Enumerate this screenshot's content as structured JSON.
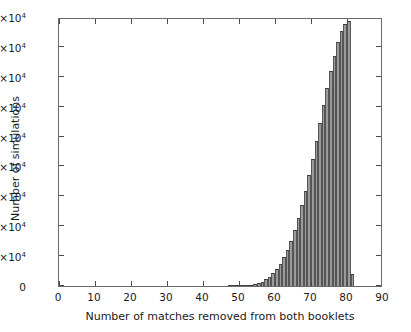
{
  "chart_data": {
    "type": "bar",
    "title": "",
    "subtitle": "",
    "xlabel": "Number of matches removed from both booklets",
    "ylabel": "Number of simulations",
    "xlim": [
      0,
      90
    ],
    "ylim": [
      0,
      90000
    ],
    "grid": false,
    "legend": null,
    "bar_style": {
      "fill_color": "#9b9b9b",
      "edge_color": "#3d3d3d",
      "bin_width": 1
    },
    "xticks": [
      0,
      10,
      20,
      30,
      40,
      50,
      60,
      70,
      80,
      90
    ],
    "xticklabels": [
      "0",
      "10",
      "20",
      "30",
      "40",
      "50",
      "60",
      "70",
      "80",
      "90"
    ],
    "yticks": [
      0,
      10000,
      20000,
      30000,
      40000,
      50000,
      60000,
      70000,
      80000,
      90000
    ],
    "yticklabels": [
      {
        "mantissa": "0",
        "exponent": ""
      },
      {
        "mantissa": "1×10",
        "exponent": "4"
      },
      {
        "mantissa": "2×10",
        "exponent": "4"
      },
      {
        "mantissa": "3×10",
        "exponent": "4"
      },
      {
        "mantissa": "4×10",
        "exponent": "4"
      },
      {
        "mantissa": "5×10",
        "exponent": "4"
      },
      {
        "mantissa": "6×10",
        "exponent": "4"
      },
      {
        "mantissa": "7×10",
        "exponent": "4"
      },
      {
        "mantissa": "8×10",
        "exponent": "4"
      },
      {
        "mantissa": "9×10",
        "exponent": "4"
      }
    ],
    "categories": [
      47,
      48,
      49,
      50,
      51,
      52,
      53,
      54,
      55,
      56,
      57,
      58,
      59,
      60,
      61,
      62,
      63,
      64,
      65,
      66,
      67,
      68,
      69,
      70,
      71,
      72,
      73,
      74,
      75,
      76,
      77,
      78,
      79,
      80,
      81
    ],
    "values": [
      200,
      150,
      120,
      300,
      250,
      400,
      500,
      700,
      1000,
      1500,
      2200,
      3000,
      4200,
      5600,
      7400,
      9600,
      12200,
      15200,
      18600,
      22600,
      27000,
      31800,
      37000,
      42600,
      48400,
      54400,
      60400,
      66200,
      71800,
      77000,
      81600,
      85200,
      87600,
      88600,
      4000
    ]
  }
}
